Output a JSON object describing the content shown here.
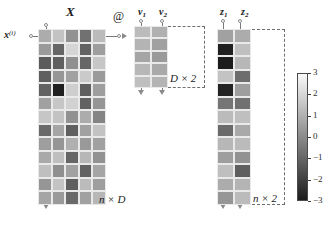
{
  "figure": {
    "operator": "@",
    "colormap": "gray-diverging",
    "background": "#ffffff"
  },
  "matrices": {
    "X": {
      "title": "X",
      "shape_label": "n × D",
      "row_label": "x",
      "row_label_sup": "(i)",
      "rows": 13,
      "cols": 5
    },
    "V": {
      "col_labels": [
        "v",
        "v"
      ],
      "col_subs": [
        "1",
        "2"
      ],
      "shape_label": "D × 2",
      "rows": 5,
      "cols": 2
    },
    "Z": {
      "col_labels": [
        "z",
        "z"
      ],
      "col_subs": [
        "1",
        "2"
      ],
      "shape_label": "n × 2",
      "rows": 13,
      "cols": 2
    }
  },
  "colorbar": {
    "ticks": [
      "3",
      "2",
      "1",
      "0",
      "-1",
      "-2",
      "-3"
    ],
    "vmin": -3,
    "vmax": 3
  },
  "chart_data": {
    "type": "heatmap",
    "title": "",
    "xlabel": "",
    "ylabel": "",
    "colorbar_label": "",
    "vmin": -3,
    "vmax": 3,
    "cmap": "gray",
    "panels": [
      {
        "name": "X",
        "shape": [
          13,
          5
        ],
        "shape_label": "n × D",
        "values": [
          [
            0.9,
            1.5,
            0.2,
            -0.7,
            1.3
          ],
          [
            0.4,
            -1.0,
            2.0,
            -1.1,
            0.5
          ],
          [
            -1.3,
            -1.2,
            0.1,
            -1.0,
            1.6
          ],
          [
            -1.2,
            0.3,
            0.6,
            1.7,
            0.4
          ],
          [
            -1.1,
            -2.9,
            1.8,
            -1.2,
            0.5
          ],
          [
            0.6,
            1.6,
            1.9,
            -1.1,
            0.3
          ],
          [
            1.6,
            1.5,
            0.2,
            0.9,
            -0.2
          ],
          [
            -0.9,
            0.7,
            -1.2,
            0.6,
            1.5
          ],
          [
            0.5,
            0.3,
            1.0,
            0.4,
            0.6
          ],
          [
            0.8,
            1.4,
            -1.0,
            1.2,
            0.2
          ],
          [
            1.4,
            0.1,
            0.6,
            -1.1,
            0.7
          ],
          [
            0.3,
            1.5,
            -1.2,
            1.3,
            0.5
          ],
          [
            0.7,
            0.4,
            -0.9,
            0.6,
            1.2
          ]
        ]
      },
      {
        "name": "V",
        "shape": [
          5,
          2
        ],
        "shape_label": "D × 2",
        "values": [
          [
            1.3,
            1.0
          ],
          [
            1.1,
            0.6
          ],
          [
            0.7,
            0.4
          ],
          [
            1.2,
            0.8
          ],
          [
            1.4,
            1.1
          ]
        ]
      },
      {
        "name": "Z",
        "shape": [
          13,
          2
        ],
        "shape_label": "n × 2",
        "values": [
          [
            0.6,
            0.9
          ],
          [
            -2.9,
            1.4
          ],
          [
            -3.0,
            1.2
          ],
          [
            1.5,
            -0.8
          ],
          [
            -2.8,
            0.5
          ],
          [
            -0.6,
            -0.7
          ],
          [
            1.3,
            1.4
          ],
          [
            -0.9,
            0.8
          ],
          [
            1.2,
            1.3
          ],
          [
            0.5,
            0.2
          ],
          [
            1.4,
            -1.2
          ],
          [
            0.9,
            1.1
          ],
          [
            0.3,
            1.3
          ]
        ]
      }
    ]
  }
}
